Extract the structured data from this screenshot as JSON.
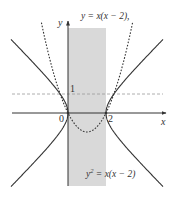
{
  "figure": {
    "width": 174,
    "height": 197,
    "colors": {
      "shade": "#d9d9d9",
      "axis": "#333333",
      "curve": "#333333",
      "dashed_guide": "#999999",
      "text": "#333333"
    }
  },
  "axes": {
    "x_label": "x",
    "y_label": "y",
    "origin_label": "0",
    "x_tick_label": "2",
    "y_tick_label": "1"
  },
  "labels": {
    "parabola_eq": "y = x(x − 2),",
    "hyperbola_eq_lhs": "y",
    "hyperbola_eq_exp": "2",
    "hyperbola_eq_rhs": " = x(x − 2)"
  },
  "diagram_data": {
    "type": "function-plot",
    "curves": [
      {
        "name": "parabola",
        "equation": "y = x(x - 2)",
        "style": "dotted",
        "vertex": [
          1,
          -1
        ],
        "roots": [
          0,
          2
        ]
      },
      {
        "name": "hyperbola",
        "equation": "y^2 = x(x - 2)",
        "style": "solid",
        "vertices": [
          [
            0,
            0
          ],
          [
            2,
            0
          ]
        ]
      }
    ],
    "shaded_region": {
      "x_range": [
        0,
        2
      ],
      "description": "vertical strip 0 ≤ x ≤ 2"
    },
    "guide_lines": [
      {
        "type": "horizontal",
        "y": 1,
        "style": "dashed"
      }
    ],
    "x_range": [
      -3,
      5
    ],
    "y_range": [
      -3.9,
      4.8
    ]
  }
}
